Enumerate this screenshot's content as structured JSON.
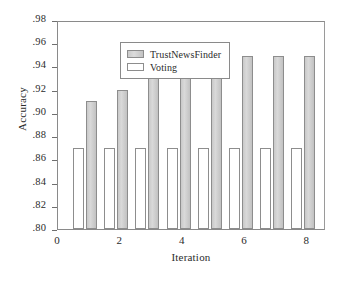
{
  "chart_data": {
    "type": "bar",
    "title": "",
    "xlabel": "Iteration",
    "ylabel": "Accuracy",
    "categories": [
      1,
      2,
      3,
      4,
      5,
      6,
      7,
      8
    ],
    "series": [
      {
        "name": "TrustNewsFinder",
        "color": "#cccccc",
        "values": [
          0.91,
          0.92,
          0.934,
          0.939,
          0.949,
          0.949,
          0.949,
          0.949
        ]
      },
      {
        "name": "Voting",
        "color": "#ffffff",
        "values": [
          0.87,
          0.87,
          0.87,
          0.87,
          0.87,
          0.87,
          0.87,
          0.87
        ]
      }
    ],
    "ylim": [
      0.8,
      0.98
    ],
    "ytick_labels": [
      ".80",
      ".82",
      ".84",
      ".86",
      ".88",
      ".90",
      ".92",
      ".94",
      ".96",
      ".98"
    ],
    "ytick_values": [
      0.8,
      0.82,
      0.84,
      0.86,
      0.88,
      0.9,
      0.92,
      0.94,
      0.96,
      0.98
    ],
    "xlim": [
      0,
      8.6
    ],
    "xtick_labels": [
      "0",
      "2",
      "4",
      "6",
      "8"
    ],
    "xtick_values": [
      0,
      2,
      4,
      6,
      8
    ],
    "xminor_values": [
      1,
      3,
      5,
      7
    ],
    "grid": false,
    "legend_position": "upper-left-inside"
  },
  "legend": {
    "entries": [
      {
        "label": "TrustNewsFinder"
      },
      {
        "label": "Voting"
      }
    ]
  },
  "caption": {
    "text": ""
  }
}
